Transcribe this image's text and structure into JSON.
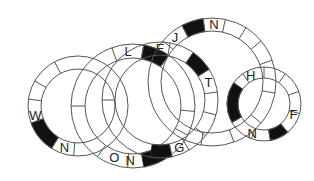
{
  "puzzle": {
    "type": "interlocking word rings",
    "rings": [
      {
        "id": "ring-1",
        "center": [
          78,
          106
        ],
        "outer_r": 50,
        "inner_r": 37,
        "dividers_deg": [
          -118,
          -150,
          -172,
          160,
          122,
          95
        ],
        "black_segments": [
          [
            122,
            160
          ]
        ],
        "letters": [
          {
            "char": "W",
            "angle": 168
          },
          {
            "char": "N",
            "angle": 108
          }
        ]
      },
      {
        "id": "ring-2",
        "center": [
          133,
          106
        ],
        "outer_r": 62,
        "inner_r": 48,
        "dividers_deg": [
          -110,
          -80,
          -55,
          5,
          28,
          55,
          95,
          125,
          180
        ],
        "black_segments": [
          [
            -80,
            -55
          ],
          [
            55,
            80
          ]
        ],
        "letters": [
          {
            "char": "L",
            "angle": -95
          },
          {
            "char": "O",
            "angle": 110
          },
          {
            "char": "N",
            "angle": 93
          }
        ]
      },
      {
        "id": "ring-3",
        "center": [
          160,
          100
        ],
        "outer_r": 58,
        "inner_r": 45,
        "dividers_deg": [
          -80,
          -55,
          -32,
          -8,
          15,
          38,
          60,
          78,
          180
        ],
        "black_segments": [
          [
            -55,
            -32
          ],
          [
            78,
            100
          ]
        ],
        "letters": [
          {
            "char": "E",
            "angle": -90
          },
          {
            "char": "T",
            "angle": -20
          },
          {
            "char": "G",
            "angle": 68
          }
        ]
      },
      {
        "id": "ring-4",
        "center": [
          212,
          82
        ],
        "outer_r": 64,
        "inner_r": 51,
        "dividers_deg": [
          -140,
          -118,
          -98,
          -78,
          -58,
          -40,
          -20,
          10,
          40,
          70,
          100
        ],
        "black_segments": [
          [
            -118,
            -98
          ]
        ],
        "letters": [
          {
            "char": "J",
            "angle": -130
          },
          {
            "char": "N",
            "angle": -88
          }
        ]
      },
      {
        "id": "ring-5",
        "center": [
          264,
          104
        ],
        "outer_r": 37,
        "inner_r": 26,
        "dividers_deg": [
          -125,
          -90,
          -55,
          -20,
          15,
          50,
          80,
          110,
          150
        ],
        "black_segments": [
          [
            150,
            215
          ],
          [
            50,
            80
          ]
        ],
        "letters": [
          {
            "char": "H",
            "angle": -115
          },
          {
            "char": "F",
            "angle": 20
          },
          {
            "char": "N",
            "angle": 112
          }
        ]
      }
    ],
    "colors": {
      "line": "#555555",
      "fill_black": "#111111",
      "letter": "#222222",
      "background": "#ffffff"
    }
  }
}
